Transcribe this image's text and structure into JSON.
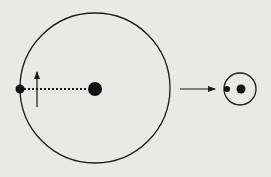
{
  "diagram": {
    "title": "",
    "colors": {
      "background": "#e9e9e7",
      "ink": "#1a1a1a"
    },
    "left_system": {
      "orbit": {
        "cx": 95,
        "cy": 88,
        "r": 75
      },
      "central_body": {
        "cx": 95,
        "cy": 89,
        "r": 7
      },
      "orbiting_body": {
        "cx": 20,
        "cy": 89,
        "r": 4.5
      },
      "separation_line": {
        "style": "dotted",
        "from": [
          24,
          89
        ],
        "to": [
          88,
          89
        ]
      },
      "velocity_arrow": {
        "direction": "up",
        "x": 37,
        "y_from": 107,
        "y_to": 71
      }
    },
    "transition_arrow": {
      "from": [
        180,
        89
      ],
      "to": [
        215,
        89
      ]
    },
    "right_system": {
      "orbit": {
        "cx": 240,
        "cy": 89,
        "r": 16
      },
      "central_body": {
        "cx": 241,
        "cy": 89,
        "r": 4.5
      },
      "orbiting_body": {
        "cx": 227,
        "cy": 89,
        "r": 3
      }
    }
  }
}
